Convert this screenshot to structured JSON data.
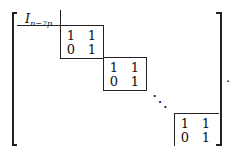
{
  "matrix": {
    "identity_label": {
      "base": "I",
      "subscript": "n−2p"
    },
    "blocks": [
      {
        "rows": [
          [
            "1",
            "1"
          ],
          [
            "0",
            "1"
          ]
        ]
      },
      {
        "rows": [
          [
            "1",
            "1"
          ],
          [
            "0",
            "1"
          ]
        ]
      },
      {
        "rows": [
          [
            "1",
            "1"
          ],
          [
            "0",
            "1"
          ]
        ]
      }
    ],
    "ellipsis": "⋱",
    "trailing_punct": "."
  }
}
